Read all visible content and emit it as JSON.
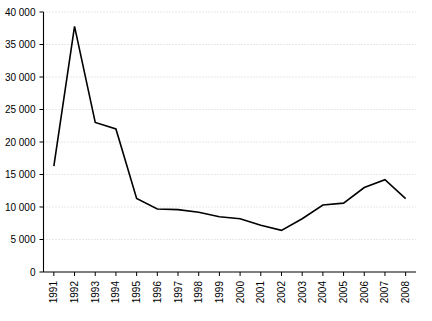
{
  "chart_data": {
    "type": "line",
    "title": "",
    "subtitle": "",
    "xlabel": "",
    "ylabel": "",
    "grid": true,
    "legend": false,
    "categories": [
      "1991",
      "1992",
      "1993",
      "1994",
      "1995",
      "1996",
      "1997",
      "1998",
      "1999",
      "2000",
      "2001",
      "2002",
      "2003",
      "2004",
      "2005",
      "2006",
      "2007",
      "2008"
    ],
    "values": [
      16300,
      37800,
      23000,
      22000,
      11300,
      9700,
      9600,
      9200,
      8500,
      8200,
      7200,
      6400,
      8200,
      10300,
      10600,
      13000,
      14200,
      11300
    ],
    "series": [
      {
        "name": "series-1",
        "color": "#000000",
        "values": [
          16300,
          37800,
          23000,
          22000,
          11300,
          9700,
          9600,
          9200,
          8500,
          8200,
          7200,
          6400,
          8200,
          10300,
          10600,
          13000,
          14200,
          11300
        ]
      }
    ],
    "ylim": [
      0,
      40000
    ],
    "ytick_values": [
      0,
      5000,
      10000,
      15000,
      20000,
      25000,
      30000,
      35000,
      40000
    ],
    "ytick_labels": [
      "0",
      "5 000",
      "10 000",
      "15 000",
      "20 000",
      "25 000",
      "30 000",
      "35 000",
      "40 000"
    ],
    "xtick_labels": [
      "1991",
      "1992",
      "1993",
      "1994",
      "1995",
      "1996",
      "1997",
      "1998",
      "1999",
      "2000",
      "2001",
      "2002",
      "2003",
      "2004",
      "2005",
      "2006",
      "2007",
      "2008"
    ]
  }
}
